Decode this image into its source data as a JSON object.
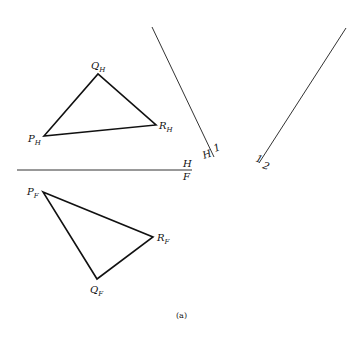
{
  "figure": {
    "caption": "(a)",
    "stroke_color": "#111111",
    "background": "#ffffff"
  },
  "top_view": {
    "P": {
      "base": "P",
      "sub": "H",
      "x": 44,
      "y": 136
    },
    "Q": {
      "base": "Q",
      "sub": "H",
      "x": 98,
      "y": 74
    },
    "R": {
      "base": "R",
      "sub": "H",
      "x": 156,
      "y": 125
    }
  },
  "front_view": {
    "P": {
      "base": "P",
      "sub": "F",
      "x": 43,
      "y": 192
    },
    "Q": {
      "base": "Q",
      "sub": "F",
      "x": 97,
      "y": 279
    },
    "R": {
      "base": "R",
      "sub": "F",
      "x": 153,
      "y": 237
    }
  },
  "fold_lines": {
    "hf": {
      "upper": "H",
      "lower": "F",
      "x1": 17,
      "y1": 170,
      "x2": 192,
      "y2": 170
    },
    "h1": {
      "left": "H",
      "right": "1",
      "x1": 152,
      "y1": 27,
      "x2": 214,
      "y2": 157
    },
    "one_two": {
      "left": "1",
      "right": "2",
      "x1": 346,
      "y1": 28,
      "x2": 259,
      "y2": 163
    }
  }
}
